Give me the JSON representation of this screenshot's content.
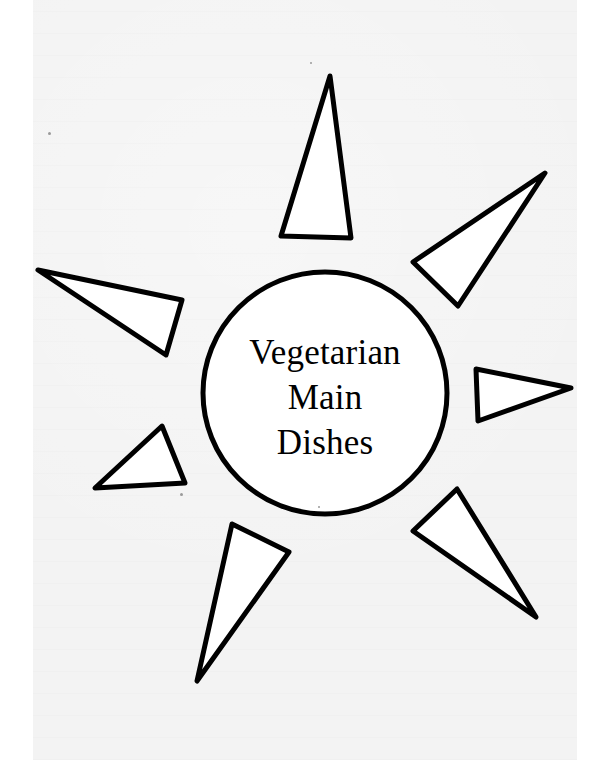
{
  "page": {
    "type": "cookbook section divider",
    "colors": {
      "background": "#ffffff",
      "paper": "#f3f3f3",
      "ink": "#000000",
      "shape_fill": "#ffffff"
    }
  },
  "illustration": {
    "name": "sun",
    "center_circle": {
      "title_lines": [
        "Vegetarian",
        "Main",
        "Dishes"
      ]
    },
    "ray_count": 7
  }
}
